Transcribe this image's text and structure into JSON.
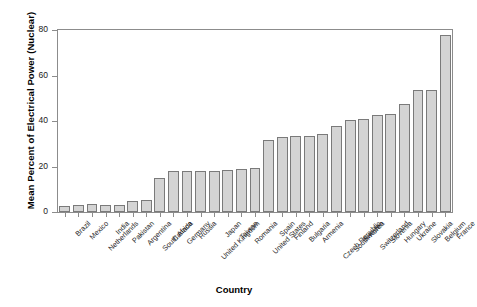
{
  "chart_data": {
    "type": "bar",
    "title": "",
    "xlabel": "Country",
    "ylabel": "Mean Percent of Electrical Power (Nuclear)",
    "ylim": [
      0,
      80
    ],
    "yticks": [
      0,
      20,
      40,
      60,
      80
    ],
    "grid": false,
    "legend": null,
    "orientation": "vertical",
    "bar_color": "#d4d4d4",
    "bar_edge_color": "#7a7a7a",
    "sorted": "ascending",
    "categories": [
      "Brazil",
      "Mexico",
      "Netherlands",
      "India",
      "Pakistan",
      "Argentina",
      "South Africa",
      "Canada",
      "Germany",
      "Russia",
      "United Kingdom",
      "Japan",
      "Taiwan",
      "Romania",
      "United States",
      "Spain",
      "Finland",
      "Bulgaria",
      "Armenia",
      "Czech Republic",
      "South Korea",
      "Sweden",
      "Switzerland",
      "Slovenia",
      "Hungary",
      "Ukraine",
      "Slovakia",
      "Belgium",
      "France"
    ],
    "values": [
      2.5,
      3.2,
      3.5,
      3.2,
      3.3,
      5.0,
      5.3,
      15.0,
      18.0,
      18.0,
      18.2,
      18.0,
      18.5,
      19.0,
      19.3,
      31.8,
      33.0,
      33.2,
      33.5,
      34.5,
      38.0,
      40.5,
      40.8,
      42.5,
      43.0,
      47.5,
      53.5,
      53.7,
      78.0
    ]
  },
  "axis": {
    "y_tick_labels": [
      "0",
      "20",
      "40",
      "60",
      "80"
    ],
    "y_title": "Mean Percent of Electrical Power (Nuclear)",
    "x_title": "Country"
  }
}
